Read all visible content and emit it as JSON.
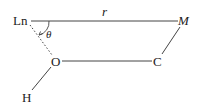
{
  "diagram": {
    "title": "",
    "nodes": [
      {
        "id": "Ln",
        "label": "Ln",
        "x": 22,
        "y": 21
      },
      {
        "id": "M",
        "label": "M",
        "x": 183,
        "y": 21,
        "italic": true
      },
      {
        "id": "O",
        "label": "O",
        "x": 56,
        "y": 61
      },
      {
        "id": "C",
        "label": "C",
        "x": 158,
        "y": 61
      },
      {
        "id": "H",
        "label": "H",
        "x": 26,
        "y": 97
      }
    ],
    "edges": [
      {
        "from": "Ln",
        "to": "M",
        "style": "solid",
        "label": "r"
      },
      {
        "from": "M",
        "to": "C",
        "style": "solid"
      },
      {
        "from": "O",
        "to": "C",
        "style": "solid"
      },
      {
        "from": "O",
        "to": "H",
        "style": "solid"
      },
      {
        "from": "Ln",
        "to": "O",
        "style": "dotted"
      }
    ],
    "angle_label": "θ",
    "distance_label": "r",
    "colors": {
      "line": "#333333",
      "text": "#222222"
    }
  }
}
